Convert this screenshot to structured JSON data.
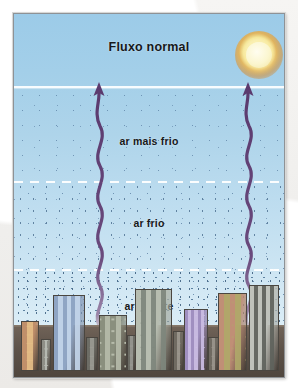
{
  "figure": {
    "title": "Fluxo normal",
    "caption_labels": {
      "top": "Fluxo normal",
      "upper_layer": "ar mais frio",
      "middle_layer": "ar frio",
      "lower_layer": "ar quente"
    },
    "colors": {
      "sky_top": "#9ccbe8",
      "sky_bottom": "#dceef7",
      "arrow": "#5b3a6e",
      "sun_core": "#fbf6cf",
      "sun_glow": "#d78c2d",
      "ground": "#5d5249",
      "frame_border": "#8e9296",
      "label_text": "#16181b",
      "divider": "#ffffff"
    },
    "layers": [
      {
        "name": "ar mais frio",
        "label": "ar mais frio",
        "density": "sparse"
      },
      {
        "name": "ar frio",
        "label": "ar frio",
        "density": "medium"
      },
      {
        "name": "ar quente",
        "label": "ar quente",
        "density": "dense"
      }
    ],
    "dividers": [
      {
        "style": "solid",
        "y": 72
      },
      {
        "style": "dashed",
        "y": 167
      },
      {
        "style": "dashed",
        "y": 255
      }
    ],
    "sun": {
      "name": "sun",
      "label": "Sol"
    },
    "arrows": [
      {
        "name": "convection-arrow-left",
        "direction": "up",
        "x": 85
      },
      {
        "name": "convection-arrow-right",
        "direction": "up",
        "x": 234
      }
    ],
    "buildings": [
      {
        "id": 1,
        "x": 10,
        "w": 24,
        "h": 50,
        "color": "#c08f6a",
        "window_color": "#e4bd86",
        "cols": 1,
        "rows": 5
      },
      {
        "id": 2,
        "x": 37,
        "w": 14,
        "h": 32,
        "color": "#8e8e86",
        "window_color": "#b9bcb4",
        "cols": 1,
        "rows": 3
      },
      {
        "id": 3,
        "x": 53,
        "w": 44,
        "h": 76,
        "color": "#8fa5c4",
        "window_color": "#c3d5ea",
        "cols": 3,
        "rows": 7
      },
      {
        "id": 4,
        "x": 99,
        "w": 16,
        "h": 34,
        "color": "#6d6d66",
        "window_color": "#9a9a92",
        "cols": 1,
        "rows": 3
      },
      {
        "id": 5,
        "x": 116,
        "w": 38,
        "h": 56,
        "color": "#8a8f7e",
        "window_color": "#b6bbaa",
        "cols": 2,
        "rows": 4
      },
      {
        "id": 6,
        "x": 155,
        "w": 12,
        "h": 36,
        "color": "#6b6b64",
        "window_color": "#969690",
        "cols": 1,
        "rows": 3
      },
      {
        "id": 7,
        "x": 166,
        "w": 50,
        "h": 82,
        "color": "#b7bdb0",
        "window_color": "#7e867c",
        "cols": 3,
        "rows": 6
      },
      {
        "id": 8,
        "x": 217,
        "w": 16,
        "h": 40,
        "color": "#706b62",
        "window_color": "#9c978e",
        "cols": 1,
        "rows": 3
      },
      {
        "id": 9,
        "x": 232,
        "w": 34,
        "h": 62,
        "color": "#a08fc0",
        "window_color": "#cbbde3",
        "cols": 3,
        "rows": 5
      },
      {
        "id": 10,
        "x": 266,
        "w": 14,
        "h": 34,
        "color": "#6f6a61",
        "window_color": "#9a958c",
        "cols": 1,
        "rows": 3
      },
      {
        "id": 11,
        "x": 279,
        "w": 40,
        "h": 78,
        "color": "#c08f76",
        "window_color": "#b0a86a",
        "cols": 2,
        "rows": 6
      },
      {
        "id": 12,
        "x": 322,
        "w": 40,
        "h": 86,
        "color": "#bfc2bb",
        "window_color": "#5f625c",
        "cols": 3,
        "rows": 7
      }
    ]
  }
}
